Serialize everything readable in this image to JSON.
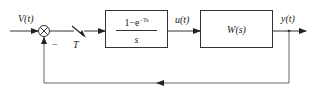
{
  "diagram": {
    "type": "sampled-data feedback control loop block diagram",
    "signals": {
      "input": "V(t)",
      "control": "u(t)",
      "output": "y(t)"
    },
    "summing_junction": {
      "feedback_sign": "−"
    },
    "sampler": {
      "label": "T"
    },
    "blocks": [
      {
        "id": "zero-order-hold",
        "numerator": "1−e",
        "numerator_exponent": "−Ts",
        "denominator": "s"
      },
      {
        "id": "plant",
        "label": "W(s)"
      }
    ],
    "colors": {
      "line": "#333333",
      "text": "#1a1a1a",
      "background": "#ffffff"
    }
  }
}
